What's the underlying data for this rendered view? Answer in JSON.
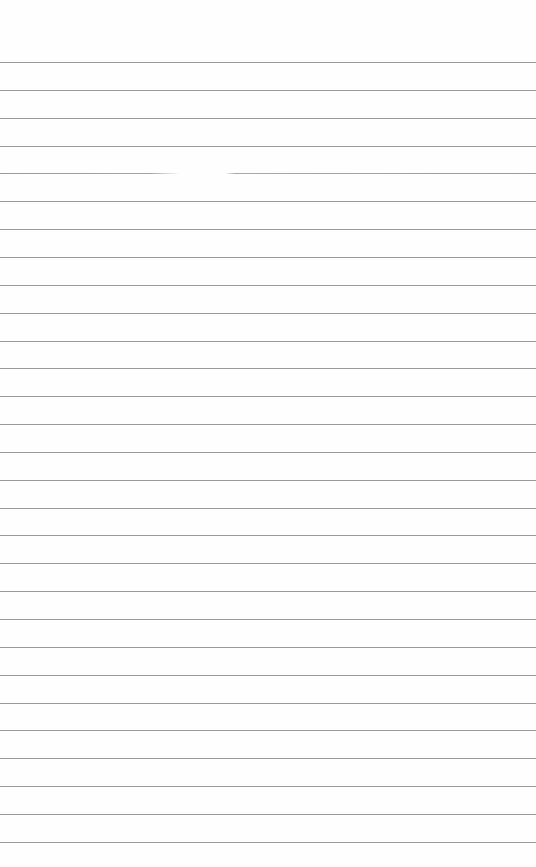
{
  "paper": {
    "background": "#fefefe",
    "rule_color": "#8f8f8f",
    "rule_count": 29,
    "first_rule_y": 62,
    "rule_spacing": 27.85,
    "faded_rule_index": 4
  }
}
